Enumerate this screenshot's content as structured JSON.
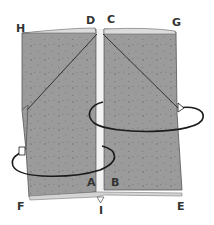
{
  "diagram": {
    "type": "paper-folding-instruction",
    "colors": {
      "paper": "#9b9b9b",
      "paper_speckle": "#6f6f6f",
      "edge": "#555555",
      "arrow": "#1a1a1a",
      "gap": "#f2f2f2",
      "label": "#333333"
    },
    "labels": {
      "H": "H",
      "D": "D",
      "C": "C",
      "G": "G",
      "A": "A",
      "B": "B",
      "F": "F",
      "I": "I",
      "E": "E"
    },
    "arrows": [
      {
        "name": "upper-rotation-arrow",
        "direction": "around right panel, arrowhead on right side"
      },
      {
        "name": "lower-rotation-arrow",
        "direction": "around left panel, arrowhead on left side"
      }
    ]
  }
}
